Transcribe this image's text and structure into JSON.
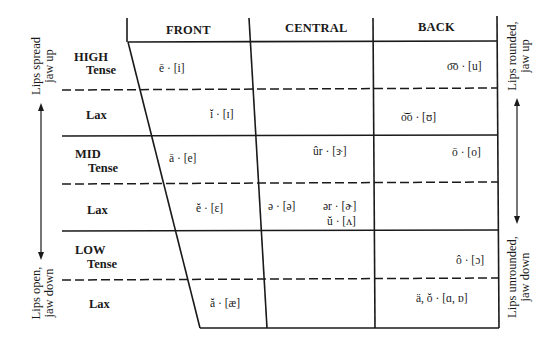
{
  "diagram": {
    "type": "vowel-chart",
    "columns": [
      {
        "label": "FRONT"
      },
      {
        "label": "CENTRAL"
      },
      {
        "label": "BACK"
      }
    ],
    "rows": {
      "high": {
        "label": "HIGH",
        "tense": "Tense",
        "lax": "Lax"
      },
      "mid": {
        "label": "MID",
        "tense": "Tense",
        "lax": "Lax"
      },
      "low": {
        "label": "LOW",
        "tense": "Tense",
        "lax": "Lax"
      }
    },
    "side_labels": {
      "left_top": [
        "Lips spread",
        "jaw up"
      ],
      "left_bottom": [
        "Lips open,",
        "jaw down"
      ],
      "right_top": [
        "Lips rounded,",
        "jaw up"
      ],
      "right_bottom": [
        "Lips unrounded,",
        "jaw down"
      ]
    },
    "vowels": {
      "high_tense_front": "ē · [i]",
      "high_tense_back": "o͞o · [u]",
      "high_lax_front": "ĭ · [ɪ]",
      "high_lax_back": "o͝o · [ʊ]",
      "mid_tense_front": "ā · [e]",
      "mid_tense_central": "ûr · [ɝ]",
      "mid_tense_back": "ō · [o]",
      "mid_lax_front": "ĕ · [ɛ]",
      "mid_lax_central_schwa": "ə · [ə]",
      "mid_lax_central_er": "ər · [ɚ]",
      "mid_lax_central_u": "ŭ · [ʌ]",
      "low_tense_back": "ô · [ɔ]",
      "low_lax_front": "ă · [æ]",
      "low_lax_back": "ä, ŏ · [ɑ, ɒ]"
    },
    "colors": {
      "ink": "#1a1a1a",
      "background": "#ffffff"
    }
  }
}
